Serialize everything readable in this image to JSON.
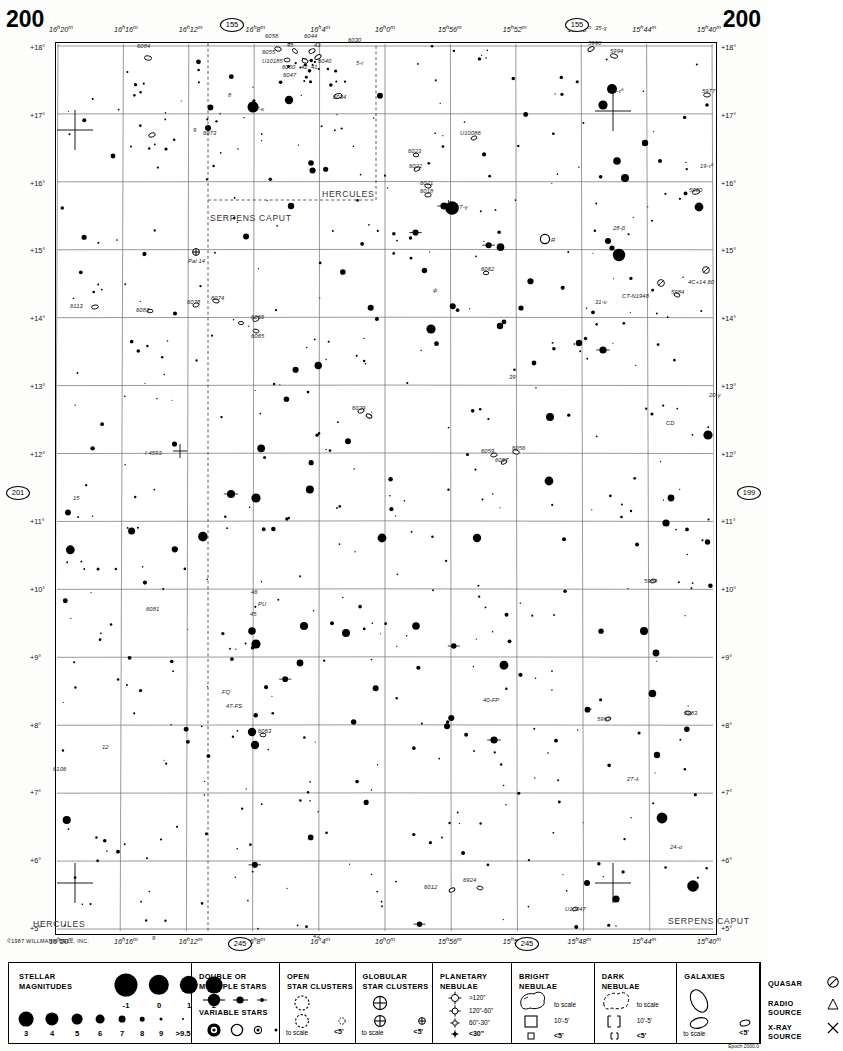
{
  "chart": {
    "number_left": "200",
    "number_right": "200",
    "copyright": "©1987 WILLMANN-BELL, INC.",
    "footnote": "Epoch 2000.0"
  },
  "axes": {
    "ra_labels": [
      {
        "text": "16h20m",
        "x": 0.0
      },
      {
        "text": "16h16m",
        "x": 0.1106
      },
      {
        "text": "16h12m",
        "x": 0.2212
      },
      {
        "text": "16h8m",
        "x": 0.3318
      },
      {
        "text": "16h4m",
        "x": 0.4424
      },
      {
        "text": "16h0m",
        "x": 0.553
      },
      {
        "text": "15h56m",
        "x": 0.6636
      },
      {
        "text": "15h52m",
        "x": 0.7742
      },
      {
        "text": "15h48m",
        "x": 0.8848
      },
      {
        "text": "15h44m",
        "x": 0.94
      },
      {
        "text": "15h40m",
        "x": 1.0
      }
    ],
    "ra_top_x": [
      0.042,
      0.152,
      0.262,
      0.372,
      0.482,
      0.592,
      0.7,
      0.808,
      0.905,
      1.01
    ],
    "ra_bot_x": [
      0.042,
      0.152,
      0.262,
      0.372,
      0.482,
      0.592,
      0.7,
      0.808,
      0.905,
      1.01
    ],
    "ra_tick_text": [
      "16h20m",
      "16h16m",
      "16h12m",
      "16h8m",
      "16h4m",
      "16h0m",
      "15h56m",
      "15h52m",
      "15h48m",
      "15h44m",
      "15h40m"
    ],
    "dec_labels": [
      "+18°",
      "+17°",
      "+16°",
      "+15°",
      "+14°",
      "+13°",
      "+12°",
      "+11°",
      "+10°",
      "+9°",
      "+8°",
      "+7°",
      "+6°",
      "+5°"
    ]
  },
  "adjacent_charts": [
    {
      "label": "155",
      "x": 232,
      "y": 25
    },
    {
      "label": "155",
      "x": 577,
      "y": 25
    },
    {
      "label": "201",
      "x": 18,
      "y": 493
    },
    {
      "label": "199",
      "x": 749,
      "y": 493
    },
    {
      "label": "245",
      "x": 240,
      "y": 944
    },
    {
      "label": "245",
      "x": 527,
      "y": 944
    }
  ],
  "constellations": [
    {
      "name": "HERCULES",
      "x": 322,
      "y": 189
    },
    {
      "name": "SERPENS CAPUT",
      "x": 210,
      "y": 213
    },
    {
      "name": "HERCULES",
      "x": 33,
      "y": 919
    },
    {
      "name": "SERPENS CAPUT",
      "x": 668,
      "y": 916
    }
  ],
  "object_labels": [
    {
      "text": "6084",
      "x": 137,
      "y": 43
    },
    {
      "text": "6058",
      "x": 265,
      "y": 33
    },
    {
      "text": "6044",
      "x": 304,
      "y": 33
    },
    {
      "text": "45",
      "x": 287,
      "y": 42
    },
    {
      "text": "43",
      "x": 314,
      "y": 42
    },
    {
      "text": "6055",
      "x": 262,
      "y": 49
    },
    {
      "text": "U10185",
      "x": 262,
      "y": 58
    },
    {
      "text": "6040",
      "x": 318,
      "y": 58
    },
    {
      "text": "6050",
      "x": 282,
      "y": 64
    },
    {
      "text": "42",
      "x": 301,
      "y": 64
    },
    {
      "text": "41",
      "x": 311,
      "y": 64
    },
    {
      "text": "6047",
      "x": 283,
      "y": 72
    },
    {
      "text": "6030",
      "x": 348,
      "y": 37
    },
    {
      "text": "6034",
      "x": 333,
      "y": 94
    },
    {
      "text": "5-r",
      "x": 356,
      "y": 60
    },
    {
      "text": "6073",
      "x": 203,
      "y": 130
    },
    {
      "text": "5996",
      "x": 588,
      "y": 40
    },
    {
      "text": "5994",
      "x": 610,
      "y": 48
    },
    {
      "text": "5977",
      "x": 702,
      "y": 88
    },
    {
      "text": "U10086",
      "x": 460,
      "y": 130
    },
    {
      "text": "6023",
      "x": 408,
      "y": 148
    },
    {
      "text": "6022",
      "x": 409,
      "y": 163
    },
    {
      "text": "6021",
      "x": 420,
      "y": 180
    },
    {
      "text": "6018",
      "x": 420,
      "y": 188
    },
    {
      "text": "5980",
      "x": 689,
      "y": 187
    },
    {
      "text": "4C+14.60",
      "x": 688,
      "y": 279
    },
    {
      "text": "CT-N1948",
      "x": 622,
      "y": 293
    },
    {
      "text": "5984",
      "x": 671,
      "y": 289
    },
    {
      "text": "31-ν",
      "x": 595,
      "y": 299
    },
    {
      "text": "6113",
      "x": 70,
      "y": 303
    },
    {
      "text": "6083",
      "x": 136,
      "y": 307
    },
    {
      "text": "6078",
      "x": 187,
      "y": 299
    },
    {
      "text": "6074",
      "x": 211,
      "y": 295
    },
    {
      "text": "Pal 14",
      "x": 188,
      "y": 258
    },
    {
      "text": "6066",
      "x": 251,
      "y": 314
    },
    {
      "text": "6065",
      "x": 251,
      "y": 333
    },
    {
      "text": "6062",
      "x": 481,
      "y": 266
    },
    {
      "text": "ψ",
      "x": 433,
      "y": 287
    },
    {
      "text": "39",
      "x": 509,
      "y": 374
    },
    {
      "text": "20-γ",
      "x": 709,
      "y": 392
    },
    {
      "text": "CD",
      "x": 666,
      "y": 420
    },
    {
      "text": "6029",
      "x": 352,
      "y": 405
    },
    {
      "text": "6059",
      "x": 481,
      "y": 448
    },
    {
      "text": "6056",
      "x": 512,
      "y": 445
    },
    {
      "text": "6057",
      "x": 495,
      "y": 457
    },
    {
      "text": "I 4593",
      "x": 145,
      "y": 450
    },
    {
      "text": "15",
      "x": 73,
      "y": 495
    },
    {
      "text": "5988",
      "x": 644,
      "y": 578
    },
    {
      "text": "6081",
      "x": 146,
      "y": 606
    },
    {
      "text": "46",
      "x": 251,
      "y": 589
    },
    {
      "text": "PU",
      "x": 258,
      "y": 601
    },
    {
      "text": "45",
      "x": 250,
      "y": 611
    },
    {
      "text": "FQ",
      "x": 222,
      "y": 689
    },
    {
      "text": "47-FS",
      "x": 226,
      "y": 703
    },
    {
      "text": "40-FP",
      "x": 483,
      "y": 697
    },
    {
      "text": "5997",
      "x": 597,
      "y": 716
    },
    {
      "text": "5983",
      "x": 684,
      "y": 710
    },
    {
      "text": "6063",
      "x": 258,
      "y": 728
    },
    {
      "text": "12",
      "x": 102,
      "y": 744
    },
    {
      "text": "6106",
      "x": 53,
      "y": 766
    },
    {
      "text": "27-λ",
      "x": 627,
      "y": 776
    },
    {
      "text": "24-α",
      "x": 670,
      "y": 844
    },
    {
      "text": "6012",
      "x": 424,
      "y": 884
    },
    {
      "text": "6924",
      "x": 463,
      "y": 877
    },
    {
      "text": "U10047",
      "x": 565,
      "y": 906
    },
    {
      "text": "9",
      "x": 152,
      "y": 935
    },
    {
      "text": "43",
      "x": 313,
      "y": 933
    },
    {
      "text": "7-κ",
      "x": 256,
      "y": 106
    },
    {
      "text": "8",
      "x": 228,
      "y": 92
    },
    {
      "text": "9",
      "x": 193,
      "y": 127
    },
    {
      "text": "26-τ⁸",
      "x": 610,
      "y": 88
    },
    {
      "text": "19-τ⁶",
      "x": 700,
      "y": 163
    },
    {
      "text": "28-β",
      "x": 613,
      "y": 225
    },
    {
      "text": "47-γ",
      "x": 456,
      "y": 204
    },
    {
      "text": "35-χ",
      "x": 595,
      "y": 25
    },
    {
      "text": "R",
      "x": 551,
      "y": 237
    }
  ],
  "legend": {
    "stellar_magnitudes": {
      "title_line1": "STELLAR",
      "title_line2": "MAGNITUDES",
      "top_row": [
        "-1",
        "0",
        "1",
        "2"
      ],
      "bottom_row": [
        "3",
        "4",
        "5",
        "6",
        "7",
        "8",
        "9",
        ">9.5"
      ]
    },
    "double_multiple": {
      "title_line1": "DOUBLE  OR",
      "title_line2": "MULTIPLE  STARS"
    },
    "variable_stars": {
      "title": "VARIABLE  STARS"
    },
    "open_clusters": {
      "title_line1": "OPEN",
      "title_line2": "STAR CLUSTERS",
      "note_left": "to scale",
      "note_right": "<5'"
    },
    "globular_clusters": {
      "title_line1": "GLOBULAR",
      "title_line2": "STAR CLUSTERS",
      "note_left": "to scale",
      "note_right": "<5'"
    },
    "planetary_nebulae": {
      "title_line1": "PLANETARY",
      "title_line2": "NEBULAE",
      "rows": [
        ">120\"",
        "120\"-60\"",
        "60\"-30\"",
        "<30\""
      ]
    },
    "bright_nebulae": {
      "title_line1": "BRIGHT",
      "title_line2": "NEBULAE",
      "rows": [
        "to scale",
        "10'-5'",
        "<5'"
      ]
    },
    "dark_nebulae": {
      "title_line1": "DARK",
      "title_line2": "NEBULAE",
      "rows": [
        "to scale",
        "10'-5'",
        "<5'"
      ]
    },
    "galaxies": {
      "title": "GALAXIES",
      "note_left": "to scale",
      "note_right": "<5'"
    },
    "other_objects": {
      "quasar": "QUASAR",
      "radio_line1": "RADIO",
      "radio_line2": "SOURCE",
      "xray_line1": "X-RAY",
      "xray_line2": "SOURCE"
    }
  },
  "chart_data": {
    "type": "scatter",
    "xlabel": "Right Ascension",
    "ylabel": "Declination",
    "xlim": [
      "16h20m",
      "15h40m"
    ],
    "ylim": [
      "+5°",
      "+18°"
    ],
    "grid": true,
    "ra_ticks": [
      "16h20m",
      "16h16m",
      "16h12m",
      "16h8m",
      "16h4m",
      "16h0m",
      "15h56m",
      "15h52m",
      "15h48m",
      "15h44m",
      "15h40m"
    ],
    "dec_ticks": [
      "+18°",
      "+17°",
      "+16°",
      "+15°",
      "+14°",
      "+13°",
      "+12°",
      "+11°",
      "+10°",
      "+9°",
      "+8°",
      "+7°",
      "+6°",
      "+5°"
    ],
    "legend_position": "below-chart",
    "series": [
      {
        "name": "stars",
        "marker": "filled-circle",
        "count": 470
      },
      {
        "name": "galaxies",
        "marker": "open-ellipse",
        "count": 44
      },
      {
        "name": "globular-clusters",
        "marker": "crossed-circle",
        "count": 1
      },
      {
        "name": "quasars",
        "marker": "circle-slash",
        "count": 2
      }
    ]
  }
}
